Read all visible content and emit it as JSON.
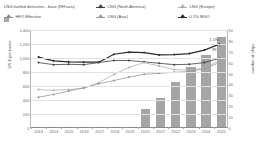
{
  "legend": [
    {
      "label": "LNG-fuelled deliveries - base (RH axis)",
      "marker": "bar",
      "color": "#a8a8a8",
      "col": "c0"
    },
    {
      "label": "LNG (North America)",
      "marker": "line",
      "color": "#3f3f3f",
      "col": "c1"
    },
    {
      "label": "LNG (Europe)",
      "marker": "line",
      "color": "#b0b0b0",
      "col": "c2"
    },
    {
      "label": "HFO Effective",
      "marker": "line",
      "color": "#8a8a8a",
      "col": "c0"
    },
    {
      "label": "LNG (Asia)",
      "marker": "line",
      "color": "#9a9a9a",
      "col": "c1"
    },
    {
      "label": "0.1% MGO",
      "marker": "line",
      "color": "#2b2b2b",
      "col": "c2"
    }
  ],
  "chart_data": {
    "type": "line",
    "title": "",
    "xlabel": "",
    "ylabel": "US $ per tonne",
    "y2label": "number of ships",
    "ylim": [
      0,
      1400
    ],
    "y2lim": [
      0,
      90
    ],
    "yticks": [
      "0",
      "200",
      "400",
      "600",
      "800",
      "1,000",
      "1,200",
      "1,400"
    ],
    "y2ticks": [
      "0",
      "10",
      "20",
      "30",
      "40",
      "50",
      "60",
      "70",
      "80",
      "90"
    ],
    "grid": true,
    "legend_position": "top",
    "categories": [
      "2013",
      "2014",
      "2015",
      "2016",
      "2017",
      "2018",
      "2019",
      "2020",
      "2021",
      "2022",
      "2023",
      "2024",
      "2025"
    ],
    "bar_series": {
      "name": "LNG-fuelled deliveries - base (RH axis)",
      "axis": "right",
      "color": "#a5a5a5",
      "values": [
        0,
        0,
        0,
        0,
        0,
        0,
        0,
        17,
        27,
        41,
        55,
        66,
        83
      ]
    },
    "series": [
      {
        "name": "0.1% MGO",
        "axis": "left",
        "color": "#2b2b2b",
        "values": [
          1010,
          955,
          940,
          935,
          935,
          1050,
          1080,
          1075,
          1040,
          1045,
          1060,
          1110,
          1195
        ]
      },
      {
        "name": "LNG (North America)",
        "axis": "left",
        "color": "#3f3f3f",
        "values": [
          930,
          900,
          905,
          900,
          930,
          960,
          960,
          940,
          920,
          900,
          905,
          930,
          990
        ]
      },
      {
        "name": "LNG (Europe)",
        "axis": "left",
        "color": "#b0b0b0",
        "values": [
          540,
          530,
          540,
          560,
          640,
          760,
          860,
          930,
          880,
          830,
          820,
          850,
          960
        ]
      },
      {
        "name": "LNG (Asia)",
        "axis": "left",
        "color": "#9a9a9a",
        "values": [
          430,
          470,
          520,
          565,
          625,
          670,
          720,
          760,
          775,
          790,
          800,
          840,
          930
        ]
      }
    ],
    "data_labels": [
      {
        "series": "0.1% MGO",
        "category": "2025",
        "text": "1,195"
      },
      {
        "series": "LNG-fuelled deliveries - base (RH axis)",
        "category": "2025",
        "text": "83"
      }
    ]
  }
}
